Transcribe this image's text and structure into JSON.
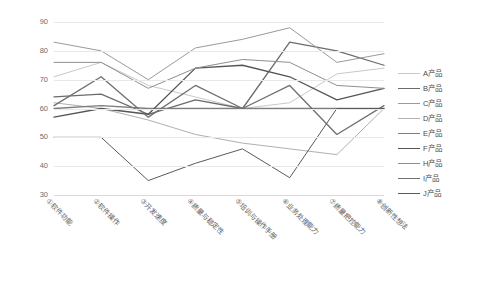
{
  "chart_data": {
    "type": "line",
    "title": "",
    "subtitle": "",
    "xlabel": "",
    "ylabel": "",
    "ylim": [
      30,
      90
    ],
    "ytick_step": 10,
    "yticks": [
      90,
      80,
      70,
      60,
      50,
      40,
      30
    ],
    "grid": true,
    "legend_position": "right",
    "categories": [
      "①软件功能",
      "②软件操作",
      "③开发速度",
      "④质量与稳定性",
      "⑤培训与操作手册",
      "⑥业务处理能力",
      "⑦质量把控能力",
      "⑧创新性想法"
    ],
    "series": [
      {
        "name": "A产品",
        "color": "#c9c9c9",
        "width": 1.0,
        "values": [
          71,
          76,
          68,
          64,
          60,
          62,
          72,
          74
        ]
      },
      {
        "name": "B产品",
        "color": "#6b6b6b",
        "width": 1.3,
        "values": [
          64,
          65,
          58,
          63,
          60,
          83,
          80,
          75
        ]
      },
      {
        "name": "C产品",
        "color": "#9a9a9a",
        "width": 1.0,
        "values": [
          83,
          80,
          70,
          81,
          84,
          88,
          76,
          79
        ]
      },
      {
        "name": "D产品",
        "color": "#b0b0b0",
        "width": 1.0,
        "values": [
          62,
          60,
          56,
          51,
          48,
          46,
          44,
          60
        ]
      },
      {
        "name": "E产品",
        "color": "#7d7d7d",
        "width": 1.3,
        "values": [
          60,
          61,
          60,
          60,
          60,
          60,
          60,
          60
        ]
      },
      {
        "name": "F产品",
        "color": "#555555",
        "width": 1.3,
        "values": [
          57,
          60,
          58,
          74,
          75,
          71,
          63,
          67
        ]
      },
      {
        "name": "H产品",
        "color": "#8f8f8f",
        "width": 1.0,
        "values": [
          76,
          76,
          67,
          74,
          77,
          76,
          68,
          67
        ]
      },
      {
        "name": "I产品",
        "color": "#6f6f6f",
        "width": 1.3,
        "values": [
          61,
          71,
          57,
          68,
          60,
          68,
          51,
          61
        ]
      },
      {
        "name": "J产品",
        "color": "#5a5a5a",
        "width": 1.0,
        "values": [
          50,
          50,
          35,
          41,
          46,
          36,
          60,
          60
        ]
      }
    ]
  },
  "legend": {
    "items": [
      {
        "label": "A产品"
      },
      {
        "label": "B产品"
      },
      {
        "label": "C产品"
      },
      {
        "label": "D产品"
      },
      {
        "label": "E产品"
      },
      {
        "label": "F产品"
      },
      {
        "label": "H产品"
      },
      {
        "label": "I产品"
      },
      {
        "label": "J产品"
      }
    ]
  }
}
